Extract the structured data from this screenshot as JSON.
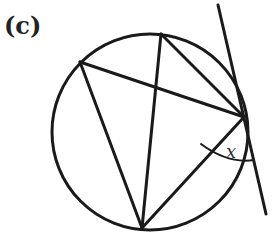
{
  "figure": {
    "part_label": "(c)",
    "angle_label": "x",
    "stroke_color": "#1a1a1a",
    "background": "#ffffff",
    "circle": {
      "cx": 150,
      "cy": 132,
      "r": 98
    },
    "points": {
      "A": {
        "x": 80,
        "y": 62
      },
      "B": {
        "x": 161,
        "y": 34
      },
      "C": {
        "x": 244,
        "y": 117
      },
      "D": {
        "x": 142,
        "y": 228
      }
    },
    "chords": [
      [
        "A",
        "C"
      ],
      [
        "A",
        "D"
      ],
      [
        "B",
        "C"
      ],
      [
        "B",
        "D"
      ],
      [
        "C",
        "D"
      ]
    ],
    "tangent": {
      "x1": 218,
      "y1": 5,
      "x2": 266,
      "y2": 214
    },
    "angle_arc": {
      "vertex": "C",
      "radius": 42,
      "between": [
        "chord CD",
        "tangent at C"
      ]
    }
  }
}
